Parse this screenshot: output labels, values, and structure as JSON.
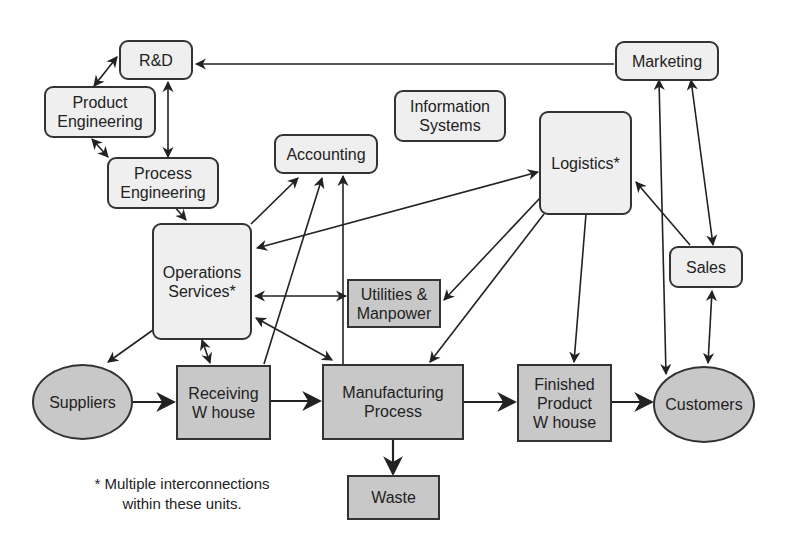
{
  "diagram": {
    "title": "",
    "nodes": {
      "rd": {
        "label": "R&D",
        "shape": "rounded"
      },
      "product_engineering": {
        "label": "Product\nEngineering",
        "shape": "rounded"
      },
      "process_engineering": {
        "label": "Process\nEngineering",
        "shape": "rounded"
      },
      "accounting": {
        "label": "Accounting",
        "shape": "rounded"
      },
      "information_systems": {
        "label": "Information\nSystems",
        "shape": "rounded"
      },
      "marketing": {
        "label": "Marketing",
        "shape": "rounded"
      },
      "logistics": {
        "label": "Logistics*",
        "shape": "rounded"
      },
      "operations_services": {
        "label": "Operations\nServices*",
        "shape": "rounded"
      },
      "utilities_manpower": {
        "label": "Utilities &\nManpower",
        "shape": "rect"
      },
      "sales": {
        "label": "Sales",
        "shape": "rounded"
      },
      "suppliers": {
        "label": "Suppliers",
        "shape": "ellipse"
      },
      "receiving_warehouse": {
        "label": "Receiving\nW house",
        "shape": "rect"
      },
      "manufacturing_process": {
        "label": "Manufacturing\nProcess",
        "shape": "rect"
      },
      "finished_product_warehouse": {
        "label": "Finished\nProduct\nW house",
        "shape": "rect"
      },
      "customers": {
        "label": "Customers",
        "shape": "ellipse"
      },
      "waste": {
        "label": "Waste",
        "shape": "rect"
      }
    },
    "edges": [
      {
        "from": "Marketing",
        "to": "R&D",
        "type": "one-way"
      },
      {
        "from": "R&D",
        "to": "Product Engineering",
        "type": "two-way"
      },
      {
        "from": "R&D",
        "to": "Process Engineering",
        "type": "two-way"
      },
      {
        "from": "Product Engineering",
        "to": "Process Engineering",
        "type": "two-way"
      },
      {
        "from": "Process Engineering",
        "to": "Operations Services",
        "type": "one-way"
      },
      {
        "from": "Operations Services",
        "to": "Accounting",
        "type": "one-way"
      },
      {
        "from": "Receiving W house",
        "to": "Accounting",
        "type": "one-way"
      },
      {
        "from": "Manufacturing Process",
        "to": "Accounting",
        "type": "one-way"
      },
      {
        "from": "Operations Services",
        "to": "Logistics",
        "type": "two-way"
      },
      {
        "from": "Operations Services",
        "to": "Utilities & Manpower",
        "type": "two-way"
      },
      {
        "from": "Operations Services",
        "to": "Manufacturing Process",
        "type": "two-way"
      },
      {
        "from": "Operations Services",
        "to": "Receiving W house",
        "type": "two-way"
      },
      {
        "from": "Operations Services",
        "to": "Suppliers",
        "type": "one-way"
      },
      {
        "from": "Logistics",
        "to": "Utilities & Manpower",
        "type": "one-way"
      },
      {
        "from": "Logistics",
        "to": "Manufacturing Process",
        "type": "one-way"
      },
      {
        "from": "Logistics",
        "to": "Finished Product W house",
        "type": "one-way"
      },
      {
        "from": "Sales",
        "to": "Logistics",
        "type": "one-way"
      },
      {
        "from": "Customers",
        "to": "Marketing",
        "type": "two-way"
      },
      {
        "from": "Marketing",
        "to": "Sales",
        "type": "two-way"
      },
      {
        "from": "Sales",
        "to": "Customers",
        "type": "two-way"
      },
      {
        "from": "Suppliers",
        "to": "Receiving W house",
        "type": "one-way"
      },
      {
        "from": "Receiving W house",
        "to": "Manufacturing Process",
        "type": "one-way"
      },
      {
        "from": "Manufacturing Process",
        "to": "Finished Product W house",
        "type": "one-way"
      },
      {
        "from": "Finished Product W house",
        "to": "Customers",
        "type": "one-way"
      },
      {
        "from": "Manufacturing Process",
        "to": "Waste",
        "type": "one-way"
      }
    ],
    "footnote": "* Multiple interconnections\nwithin these units.",
    "colors": {
      "rounded_fill": "#efefef",
      "rect_fill": "#c8c8c8",
      "stroke": "#333333"
    }
  }
}
